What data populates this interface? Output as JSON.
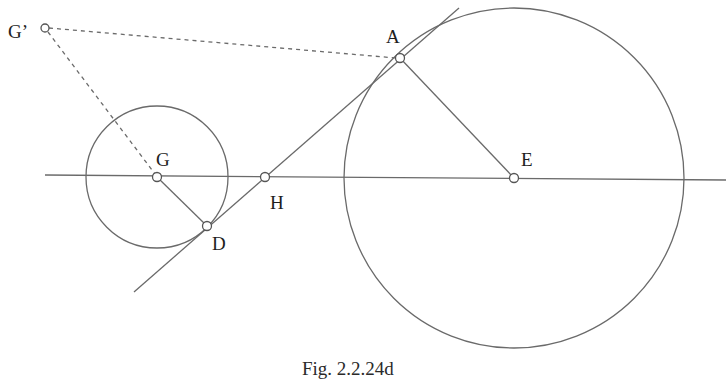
{
  "figure": {
    "caption": "Fig. 2.2.24d",
    "points": {
      "A": {
        "label": "A",
        "x": 400,
        "y": 58
      },
      "D": {
        "label": "D",
        "x": 207,
        "y": 226
      },
      "E": {
        "label": "E",
        "x": 514,
        "y": 178
      },
      "G": {
        "label": "G",
        "x": 157,
        "y": 177
      },
      "H": {
        "label": "H",
        "x": 265,
        "y": 177
      },
      "G_prime": {
        "label": "G’",
        "x": 45,
        "y": 28
      }
    },
    "circles": [
      {
        "name": "small-circle",
        "center": "G",
        "radius": 71
      },
      {
        "name": "large-circle",
        "center": "E",
        "radius": 170
      }
    ],
    "lines": [
      {
        "name": "axis-line",
        "from": [
          45,
          175
        ],
        "to": [
          726,
          180
        ]
      },
      {
        "name": "tangent-line",
        "from": [
          134,
          292
        ],
        "to": [
          459,
          8
        ]
      },
      {
        "name": "radius-EA",
        "from": "E",
        "to": "A"
      },
      {
        "name": "radius-GD",
        "from": "G",
        "to": "D"
      },
      {
        "name": "dashed-GprimeA",
        "from": "G_prime",
        "to": "A",
        "style": "dashed"
      },
      {
        "name": "dashed-GprimeG",
        "from": "G_prime",
        "to": "G",
        "style": "dashed"
      }
    ]
  }
}
